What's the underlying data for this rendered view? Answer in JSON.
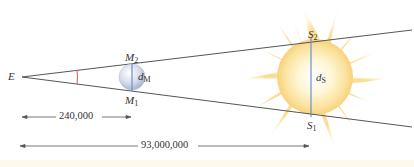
{
  "labels": {
    "earth": "E",
    "moon_top": {
      "base": "M",
      "sub": "2"
    },
    "moon_bottom": {
      "base": "M",
      "sub": "1"
    },
    "moon_diameter": {
      "base": "d",
      "sub": "M"
    },
    "sun_top": {
      "base": "S",
      "sub": "2"
    },
    "sun_bottom": {
      "base": "S",
      "sub": "1"
    },
    "sun_diameter": {
      "base": "d",
      "sub": "S"
    }
  },
  "distances": {
    "earth_moon": "240,000",
    "earth_sun": "93,000,000"
  },
  "colors": {
    "sight_lines": "#555555",
    "angle_arc": "#d9534f",
    "diameter_line": "#6a8fd0",
    "moon": "#c9d2e6",
    "sun_core": "#fffbe6",
    "sun_rays": "#f7d27a",
    "text": "#333333"
  }
}
